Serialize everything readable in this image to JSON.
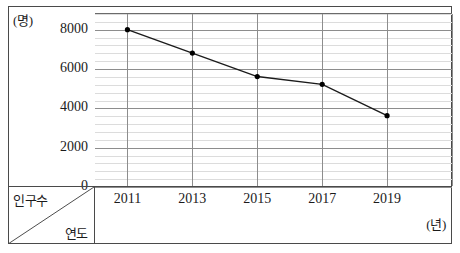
{
  "chart_data": {
    "type": "line",
    "title": "",
    "xlabel": "연도",
    "ylabel": "인구수",
    "x_unit": "(년)",
    "y_unit": "(명)",
    "categories": [
      "2011",
      "2013",
      "2015",
      "2017",
      "2019"
    ],
    "x": [
      2011,
      2013,
      2015,
      2017,
      2019
    ],
    "values": [
      8000,
      6800,
      5600,
      5200,
      3600
    ],
    "series": [
      {
        "name": "인구수",
        "values": [
          8000,
          6800,
          5600,
          5200,
          3600
        ]
      }
    ],
    "ylim": [
      0,
      8800
    ],
    "xlim": [
      2010,
      2021
    ],
    "y_major_ticks": [
      0,
      2000,
      4000,
      6000,
      8000
    ],
    "y_tick_labels": [
      "0",
      "2000",
      "4000",
      "6000",
      "8000"
    ],
    "y_minor_step": 400,
    "x_major_gridlines": [
      2011,
      2013,
      2015,
      2017,
      2019,
      2021
    ],
    "grid": true,
    "legend": "none",
    "line_color": "#1b1b1b",
    "marker_color": "#000000",
    "major_grid_color": "#8d8d8d",
    "minor_grid_color": "#dcdcdc",
    "frame_color": "#4a4a4a"
  },
  "axis_box": {
    "top_label": "인구수",
    "bottom_label": "연도"
  },
  "units": {
    "y": "(명)",
    "x": "(년)"
  }
}
